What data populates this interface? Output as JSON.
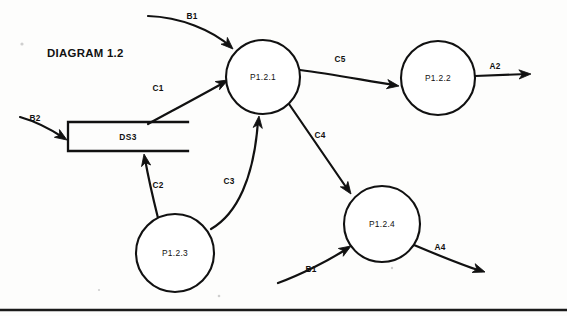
{
  "diagram": {
    "title": "DIAGRAM 1.2",
    "title_pos": {
      "x": 47,
      "y": 57
    },
    "type": "data-flow-diagram",
    "canvas": {
      "width": 567,
      "height": 316
    },
    "ink_color": "#111111",
    "background_color": "#fdfdfc",
    "page_rule": {
      "y": 310,
      "x1": 0,
      "x2": 567
    }
  },
  "processes": [
    {
      "id": "p1",
      "label": "P1.2.1",
      "cx": 263,
      "cy": 77,
      "r": 37
    },
    {
      "id": "p2",
      "label": "P1.2.2",
      "cx": 438,
      "cy": 78,
      "r": 37
    },
    {
      "id": "p3",
      "label": "P1.2.3",
      "cx": 175,
      "cy": 253,
      "r": 39
    },
    {
      "id": "p4",
      "label": "P1.2.4",
      "cx": 382,
      "cy": 224,
      "r": 38
    }
  ],
  "stores": [
    {
      "id": "ds3",
      "label": "DS3",
      "x": 68,
      "y": 122,
      "width": 120,
      "height": 29,
      "label_x": 128,
      "label_y": 140,
      "open_right": true
    }
  ],
  "flows": [
    {
      "id": "f-b1-top",
      "label": "B1",
      "from": "external",
      "to": "P1.2.1",
      "path": "M 148 16 C 180 17 212 30 231 47",
      "label_x": 192,
      "label_y": 19,
      "arrow_x": 233,
      "arrow_y": 49,
      "arrow_angle": 43
    },
    {
      "id": "f-b2",
      "label": "B2",
      "from": "external",
      "to": "DS3",
      "path": "M 20 117 C 34 121 52 130 64 138",
      "label_x": 35,
      "label_y": 121,
      "arrow_x": 67,
      "arrow_y": 140,
      "arrow_angle": 33
    },
    {
      "id": "f-c1",
      "label": "C1",
      "from": "DS3",
      "to": "P1.2.1",
      "path": "M 148 124 C 170 112 200 96 225 82",
      "label_x": 158,
      "label_y": 91,
      "arrow_x": 228,
      "arrow_y": 80,
      "arrow_angle": -28
    },
    {
      "id": "f-c2",
      "label": "C2",
      "from": "P1.2.3",
      "to": "DS3",
      "path": "M 158 218 C 153 198 148 176 145 159",
      "label_x": 158,
      "label_y": 188,
      "arrow_x": 144,
      "arrow_y": 154,
      "arrow_angle": -100
    },
    {
      "id": "f-c3",
      "label": "C3",
      "from": "P1.2.3",
      "to": "P1.2.1",
      "path": "M 211 229 C 237 214 254 178 258 121",
      "label_x": 229,
      "label_y": 184,
      "arrow_x": 259,
      "arrow_y": 116,
      "arrow_angle": -84
    },
    {
      "id": "f-c4",
      "label": "C4",
      "from": "P1.2.1",
      "to": "P1.2.4",
      "path": "M 289 104 L 348 190",
      "label_x": 320,
      "label_y": 138,
      "arrow_x": 351,
      "arrow_y": 194,
      "arrow_angle": 55
    },
    {
      "id": "f-c5",
      "label": "C5",
      "from": "P1.2.1",
      "to": "P1.2.2",
      "path": "M 300 70 C 332 74 368 81 395 85",
      "label_x": 340,
      "label_y": 62,
      "arrow_x": 399,
      "arrow_y": 86,
      "arrow_angle": 9
    },
    {
      "id": "f-a2",
      "label": "A2",
      "from": "P1.2.2",
      "to": "external",
      "path": "M 475 76 L 527 74",
      "label_x": 495,
      "label_y": 69,
      "arrow_x": 531,
      "arrow_y": 74,
      "arrow_angle": -2
    },
    {
      "id": "f-b1-bottom",
      "label": "B1",
      "from": "external",
      "to": "P1.2.4",
      "path": "M 278 283 C 300 275 330 260 348 248",
      "label_x": 311,
      "label_y": 272,
      "arrow_x": 351,
      "arrow_y": 246,
      "arrow_angle": -32
    },
    {
      "id": "f-a4",
      "label": "A4",
      "from": "P1.2.4",
      "to": "external",
      "path": "M 414 245 C 440 256 462 265 481 271",
      "label_x": 440,
      "label_y": 250,
      "arrow_x": 485,
      "arrow_y": 272,
      "arrow_angle": 19
    }
  ],
  "specks": [
    {
      "x": 22,
      "y": 44,
      "r": 1.6
    },
    {
      "x": 219,
      "y": 296,
      "r": 1.3
    },
    {
      "x": 392,
      "y": 268,
      "r": 1.2
    },
    {
      "x": 99,
      "y": 290,
      "r": 1.1
    }
  ]
}
